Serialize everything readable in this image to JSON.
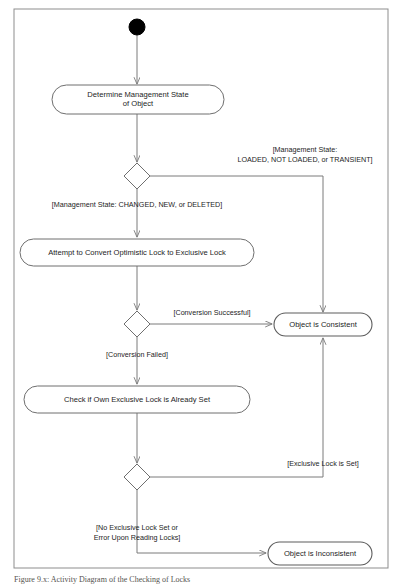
{
  "figure": {
    "kind": "uml-activity-diagram",
    "caption": "Figure 9.x: Activity Diagram of the Checking of Locks",
    "frame": {
      "x": 14,
      "y": 9,
      "width": 374,
      "height": 559
    },
    "colors": {
      "frame_stroke": "#8d8d8d",
      "node_stroke": "#6f6f6f",
      "edge_stroke": "#7b7b7b",
      "initial_fill": "#000000",
      "node_fill": "#ffffff",
      "text": "#1d1d1d"
    }
  },
  "nodes": {
    "initial": {
      "type": "initial-node",
      "label": "",
      "cx": 137,
      "cy": 27,
      "r": 8
    },
    "determine_state": {
      "type": "action",
      "lines": [
        "Determine Management State",
        "of Object"
      ],
      "x": 52,
      "y": 85,
      "width": 172,
      "height": 29
    },
    "decision_state": {
      "type": "decision",
      "label": "",
      "cx": 137,
      "cy": 176,
      "rx": 13,
      "ry": 13
    },
    "attempt_convert": {
      "type": "action",
      "lines": [
        "Attempt to Convert Optimistic Lock to Exclusive Lock"
      ],
      "x": 20,
      "y": 239,
      "width": 234,
      "height": 27
    },
    "decision_conversion": {
      "type": "decision",
      "label": "",
      "cx": 137,
      "cy": 324,
      "rx": 13,
      "ry": 13
    },
    "object_consistent": {
      "type": "final-state",
      "lines": [
        "Object is Consistent"
      ],
      "x": 274,
      "y": 313,
      "width": 98,
      "height": 23
    },
    "check_own_lock": {
      "type": "action",
      "lines": [
        "Check if Own Exclusive Lock is Already Set"
      ],
      "x": 24,
      "y": 386,
      "width": 226,
      "height": 27
    },
    "decision_own_lock": {
      "type": "decision",
      "label": "",
      "cx": 137,
      "cy": 477,
      "rx": 13,
      "ry": 13
    },
    "object_inconsistent": {
      "type": "final-state",
      "lines": [
        "Object is Inconsistent"
      ],
      "x": 268,
      "y": 542,
      "width": 104,
      "height": 23
    }
  },
  "edges": [
    {
      "name": "initial-to-determine-state",
      "path": "M 137 35 L 137 84",
      "arrow": true,
      "guard": null
    },
    {
      "name": "determine-state-to-decision",
      "path": "M 137 114 L 137 162",
      "arrow": true,
      "guard": null
    },
    {
      "name": "decision-state-to-object-consistent",
      "path": "M 150 176 L 323 176 L 323 312",
      "arrow": true,
      "guard": {
        "lines": [
          "[Management State:",
          "LOADED, NOT LOADED, or TRANSIENT]"
        ],
        "x": 305,
        "y": 152,
        "anchor": "middle"
      }
    },
    {
      "name": "decision-state-to-attempt-convert",
      "path": "M 137 189 L 137 237",
      "arrow": true,
      "guard": {
        "lines": [
          "[Management State: CHANGED, NEW, or DELETED]"
        ],
        "x": 137,
        "y": 207,
        "anchor": "middle"
      }
    },
    {
      "name": "attempt-convert-to-decision-conversion",
      "path": "M 137 266 L 137 310",
      "arrow": true,
      "guard": null
    },
    {
      "name": "conversion-successful-to-object-consistent",
      "path": "M 150 324 L 272 324",
      "arrow": true,
      "guard": {
        "lines": [
          "[Conversion Successful]"
        ],
        "x": 212,
        "y": 315,
        "anchor": "middle"
      }
    },
    {
      "name": "conversion-failed-to-check-own-lock",
      "path": "M 137 337 L 137 384",
      "arrow": true,
      "guard": {
        "lines": [
          "[Conversion Failed]"
        ],
        "x": 137,
        "y": 357,
        "anchor": "middle"
      }
    },
    {
      "name": "check-own-lock-to-decision-own-lock",
      "path": "M 137 413 L 137 463",
      "arrow": true,
      "guard": null
    },
    {
      "name": "exclusive-lock-is-set-to-object-consistent",
      "path": "M 150 477 L 323 477 L 323 338",
      "arrow": true,
      "guard": {
        "lines": [
          "[Exclusive Lock is Set]"
        ],
        "x": 323,
        "y": 466,
        "anchor": "middle"
      }
    },
    {
      "name": "no-exclusive-lock-to-object-inconsistent",
      "path": "M 137 490 L 137 553 L 266 553",
      "arrow": true,
      "guard": {
        "lines": [
          "[No Exclusive Lock Set or",
          "Error Upon Reading Locks]"
        ],
        "x": 137,
        "y": 530,
        "anchor": "middle"
      }
    }
  ]
}
